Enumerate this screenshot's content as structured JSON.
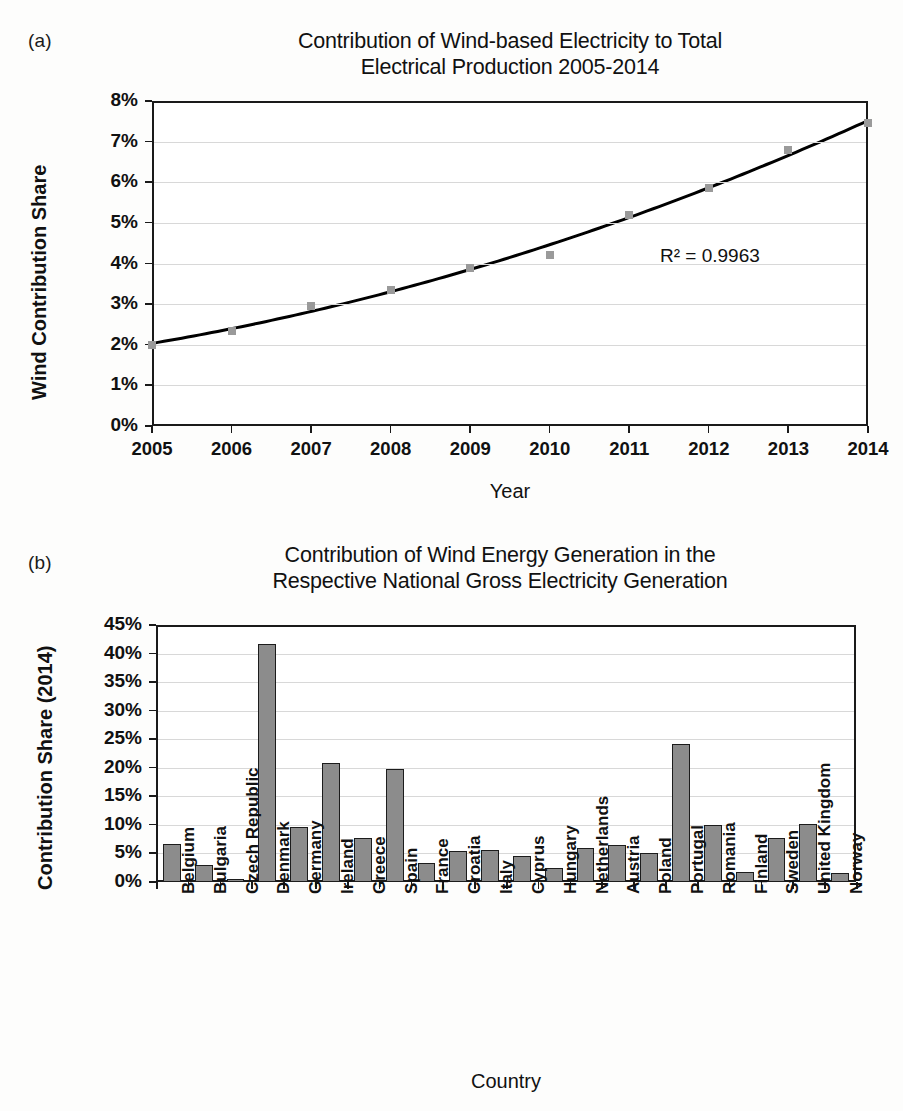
{
  "figure": {
    "panel_a_tag": "(a)",
    "panel_b_tag": "(b)"
  },
  "chart_data": [
    {
      "panel": "(a)",
      "type": "line",
      "title": "Contribution of Wind-based Electricity to Total Electrical Production 2005-2014",
      "title_line1": "Contribution of Wind-based Electricity to Total",
      "title_line2": "Electrical Production 2005-2014",
      "xlabel": "Year",
      "ylabel": "Wind Contribution Share",
      "categories": [
        "2005",
        "2006",
        "2007",
        "2008",
        "2009",
        "2010",
        "2011",
        "2012",
        "2013",
        "2014"
      ],
      "x": [
        2005,
        2006,
        2007,
        2008,
        2009,
        2010,
        2011,
        2012,
        2013,
        2014
      ],
      "values": [
        2.0,
        2.35,
        2.95,
        3.35,
        3.9,
        4.2,
        5.2,
        5.85,
        6.8,
        7.45
      ],
      "ylim": [
        0,
        8
      ],
      "ytick_labels": [
        "0%",
        "1%",
        "2%",
        "3%",
        "4%",
        "5%",
        "6%",
        "7%",
        "8%"
      ],
      "yticks": [
        0,
        1,
        2,
        3,
        4,
        5,
        6,
        7,
        8
      ],
      "grid": true,
      "legend": "none",
      "annotation": "R² = 0.9963",
      "trendline": "polynomial fit",
      "marker_color": "#9a9a9a",
      "line_color": "#000000"
    },
    {
      "panel": "(b)",
      "type": "bar",
      "title": "Contribution of Wind Energy Generation in the Respective National Gross Electricity Generation",
      "title_line1": "Contribution of Wind Energy Generation in the",
      "title_line2": "Respective National Gross Electricity Generation",
      "xlabel": "Country",
      "ylabel": "Contribution Share (2014)",
      "categories": [
        "Belgium",
        "Bulgaria",
        "Czech Republic",
        "Denmark",
        "Germany",
        "Ireland",
        "Greece",
        "Spain",
        "France",
        "Croatia",
        "Italy",
        "Cyprus",
        "Hungary",
        "Netherlands",
        "Austria",
        "Poland",
        "Portugal",
        "Romania",
        "Finland",
        "Sweden",
        "United Kingdom",
        "Norway"
      ],
      "values": [
        6.7,
        3.0,
        0.6,
        41.6,
        9.7,
        20.9,
        7.7,
        19.8,
        3.3,
        5.5,
        5.6,
        4.5,
        2.4,
        5.9,
        6.4,
        5.0,
        24.2,
        9.9,
        1.7,
        7.7,
        10.1,
        1.6
      ],
      "ylim": [
        0,
        45
      ],
      "ytick_labels": [
        "0%",
        "5%",
        "10%",
        "15%",
        "20%",
        "25%",
        "30%",
        "35%",
        "40%",
        "45%"
      ],
      "yticks": [
        0,
        5,
        10,
        15,
        20,
        25,
        30,
        35,
        40,
        45
      ],
      "grid": true,
      "legend": "none",
      "bar_color": "#8c8c8c",
      "bar_edge_color": "#1c1c1c"
    }
  ]
}
